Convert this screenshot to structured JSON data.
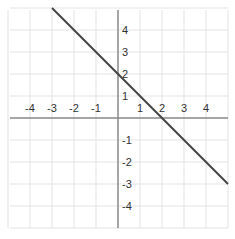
{
  "chart_data": {
    "type": "line",
    "title": "",
    "xlabel": "",
    "ylabel": "",
    "xlim": [
      -5,
      5
    ],
    "ylim": [
      -5,
      5
    ],
    "grid": true,
    "x_ticks": [
      -4,
      -3,
      -2,
      -1,
      1,
      2,
      3,
      4
    ],
    "y_ticks": [
      4,
      3,
      2,
      1,
      -1,
      -2,
      -3,
      -4
    ],
    "series": [
      {
        "name": "y = -x + 2",
        "x": [
          -3,
          5
        ],
        "y": [
          5,
          -3
        ],
        "color": "#444444"
      }
    ],
    "annotations": []
  },
  "colors": {
    "grid": "#e3e3e3",
    "axis": "#888888",
    "line": "#444444"
  }
}
